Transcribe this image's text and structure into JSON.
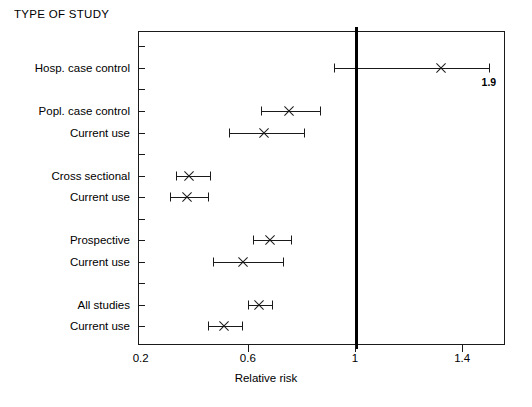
{
  "chart_data": {
    "type": "scatter",
    "subtype": "forest-plot",
    "title": "TYPE OF STUDY",
    "xlabel": "Relative risk",
    "ylabel": "",
    "xlim": [
      0.19,
      1.56
    ],
    "xticks": [
      0.2,
      0.6,
      1.0,
      1.4
    ],
    "xticklabels": [
      "0.2",
      "0.6",
      "1",
      "1.4"
    ],
    "grid": false,
    "legend": null,
    "reference_line": {
      "value": 1.0,
      "orientation": "vertical",
      "style": "thick-solid"
    },
    "categories": [
      "Hosp. case control",
      "Popl. case control",
      "Current use",
      "Cross sectional",
      "Current use",
      "Prospective",
      "Current use",
      "All studies",
      "Current use"
    ],
    "points": [
      {
        "label": "Hosp. case control",
        "estimate": 1.32,
        "ci_low": 0.92,
        "ci_high": 1.5,
        "ci_high_truncated": true,
        "annotation": "1.9"
      },
      {
        "label": "Popl. case control",
        "estimate": 0.75,
        "ci_low": 0.65,
        "ci_high": 0.87,
        "ci_high_truncated": false,
        "annotation": ""
      },
      {
        "label": "Current use",
        "estimate": 0.66,
        "ci_low": 0.53,
        "ci_high": 0.81,
        "ci_high_truncated": false,
        "annotation": ""
      },
      {
        "label": "Cross sectional",
        "estimate": 0.38,
        "ci_low": 0.33,
        "ci_high": 0.46,
        "ci_high_truncated": false,
        "annotation": ""
      },
      {
        "label": "Current use",
        "estimate": 0.37,
        "ci_low": 0.31,
        "ci_high": 0.45,
        "ci_high_truncated": false,
        "annotation": ""
      },
      {
        "label": "Prospective",
        "estimate": 0.68,
        "ci_low": 0.62,
        "ci_high": 0.76,
        "ci_high_truncated": false,
        "annotation": ""
      },
      {
        "label": "Current use",
        "estimate": 0.58,
        "ci_low": 0.47,
        "ci_high": 0.73,
        "ci_high_truncated": false,
        "annotation": ""
      },
      {
        "label": "All studies",
        "estimate": 0.64,
        "ci_low": 0.6,
        "ci_high": 0.69,
        "ci_high_truncated": false,
        "annotation": ""
      },
      {
        "label": "Current use",
        "estimate": 0.51,
        "ci_low": 0.45,
        "ci_high": 0.58,
        "ci_high_truncated": false,
        "annotation": ""
      }
    ],
    "row_slots": [
      1,
      3,
      4,
      6,
      7,
      9,
      10,
      12,
      13
    ],
    "total_slots": 14,
    "colors": {
      "axis": "#1a1a1a",
      "marker": "#1a1a1a",
      "reference_line": "#000000",
      "background": "#ffffff"
    }
  }
}
